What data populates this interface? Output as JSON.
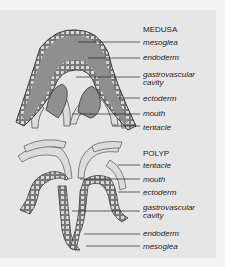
{
  "medusa": {
    "title": "MEDUSA",
    "labels": [
      "mesoglea",
      "endoderm",
      "gastrovascular",
      "cavity",
      "ectoderm",
      "mouth",
      "tentacle"
    ]
  },
  "polyp": {
    "title": "POLYP",
    "labels": [
      "tentacle",
      "mouth",
      "ectoderm",
      "gastrovascular",
      "cavity",
      "endoderm",
      "mesoglea"
    ]
  },
  "colors": {
    "panel": "#e6e6e6",
    "page": "#f4f4f4",
    "mesoglea": "#8f8f8f",
    "outline": "#3a3a3a",
    "tentacle": "#dcdcdc",
    "text": "#222222"
  }
}
